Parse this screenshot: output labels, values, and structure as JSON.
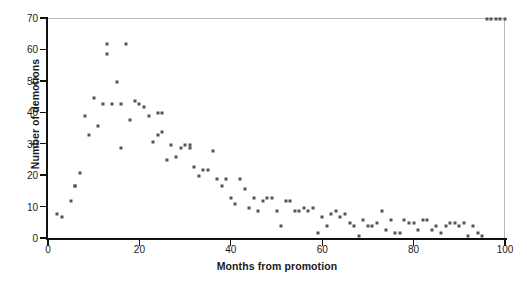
{
  "chart_data": {
    "type": "scatter",
    "title": "",
    "xlabel": "Months from promotion",
    "ylabel": "Number of demotions",
    "xlim": [
      0,
      100
    ],
    "ylim": [
      0,
      70
    ],
    "xticks": [
      0,
      20,
      40,
      60,
      80,
      100
    ],
    "yticks": [
      0,
      10,
      20,
      30,
      40,
      50,
      60,
      70
    ],
    "grid": false,
    "legend": null,
    "marker": {
      "shape": "square",
      "color": "#555558",
      "size_px": 3
    },
    "x": [
      2,
      3,
      5,
      6,
      6,
      7,
      8,
      9,
      10,
      11,
      12,
      13,
      13,
      14,
      15,
      16,
      16,
      17,
      18,
      19,
      20,
      21,
      22,
      23,
      24,
      24,
      25,
      25,
      26,
      27,
      28,
      29,
      30,
      31,
      31,
      32,
      33,
      34,
      35,
      36,
      37,
      38,
      39,
      40,
      41,
      42,
      43,
      44,
      45,
      46,
      47,
      48,
      49,
      50,
      51,
      52,
      53,
      54,
      55,
      56,
      57,
      58,
      59,
      60,
      61,
      62,
      63,
      64,
      65,
      66,
      67,
      68,
      69,
      70,
      71,
      72,
      73,
      74,
      75,
      76,
      77,
      78,
      79,
      80,
      81,
      82,
      83,
      84,
      85,
      86,
      87,
      88,
      89,
      90,
      91,
      92,
      93,
      94,
      95,
      96,
      97,
      98,
      99,
      100
    ],
    "y": [
      8,
      7,
      12,
      17,
      17,
      21,
      39,
      33,
      45,
      36,
      43,
      62,
      59,
      43,
      50,
      43,
      29,
      62,
      38,
      44,
      43,
      42,
      39,
      31,
      33,
      40,
      34,
      40,
      25,
      30,
      26,
      29,
      30,
      30,
      29,
      23,
      20,
      22,
      22,
      28,
      19,
      17,
      19,
      13,
      11,
      19,
      16,
      10,
      13,
      9,
      12,
      13,
      13,
      9,
      4,
      12,
      12,
      9,
      9,
      10,
      9,
      10,
      2,
      7,
      4,
      8,
      9,
      7,
      8,
      5,
      4,
      1,
      6,
      4,
      4,
      5,
      9,
      3,
      6,
      2,
      2,
      6,
      5,
      5,
      3,
      6,
      6,
      3,
      4,
      2,
      4,
      5,
      5,
      4,
      5,
      1,
      4,
      2,
      1
    ],
    "series_label": "demotions"
  },
  "axis": {
    "ylabel_text": "Number of demotions",
    "xlabel_text": "Months from promotion",
    "ytick_labels": [
      "0",
      "10",
      "20",
      "30",
      "40",
      "50",
      "60",
      "70"
    ],
    "xtick_labels": [
      "0",
      "20",
      "40",
      "60",
      "80",
      "100"
    ]
  },
  "colors": {
    "marker": "#555558",
    "axis": "#111111",
    "frame": "#b9b9b9",
    "text": "#1a1a1a",
    "background": "#ffffff"
  }
}
